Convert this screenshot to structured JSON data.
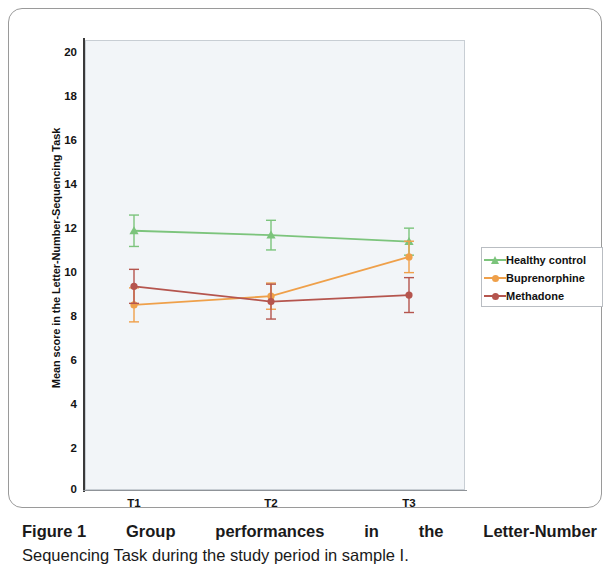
{
  "figure": {
    "caption_label": "Figure 1",
    "caption_line1_words": [
      "Group",
      "performances",
      "in",
      "the",
      "Letter-Number"
    ],
    "caption_line2": "Sequencing Task during the study period in sample I."
  },
  "axes": {
    "y_title": "Mean score in the Letter-Number-Sequencing Task",
    "y_ticks": [
      "20",
      "18",
      "16",
      "14",
      "12",
      "10",
      "8",
      "6",
      "4",
      "2",
      "0"
    ],
    "x_ticks": [
      "T1",
      "T2",
      "T3"
    ]
  },
  "legend": {
    "items": [
      {
        "label": "Healthy control",
        "color": "#7cc47c",
        "marker": "triangle-marker"
      },
      {
        "label": "Buprenorphine",
        "color": "#efa04a",
        "marker": "circle-marker"
      },
      {
        "label": "Methadone",
        "color": "#b5554e",
        "marker": "circle-marker"
      }
    ]
  },
  "colors": {
    "healthy_control": "#7cc47c",
    "buprenorphine": "#efa04a",
    "methadone": "#b5554e",
    "plot_background": "#f2f5f8",
    "axis": "#3a3a3a",
    "frame": "#9a9a9a"
  },
  "chart_data": {
    "type": "line",
    "title": "Figure 1 Group performances in the Letter-Number Sequencing Task during the study period in sample I.",
    "xlabel": "",
    "ylabel": "Mean score in the Letter-Number-Sequencing Task",
    "categories": [
      "T1",
      "T2",
      "T3"
    ],
    "ylim": [
      0,
      20
    ],
    "ytick_step": 2,
    "grid": false,
    "legend_position": "right",
    "error_bars": "standard error",
    "series": [
      {
        "name": "Healthy control",
        "color": "#7cc47c",
        "marker": "triangle",
        "values": [
          11.8,
          11.6,
          11.3
        ],
        "errors": [
          0.72,
          0.68,
          0.62
        ]
      },
      {
        "name": "Buprenorphine",
        "color": "#efa04a",
        "marker": "circle",
        "values": [
          8.4,
          8.8,
          10.6
        ],
        "errors": [
          0.78,
          0.6,
          0.72
        ]
      },
      {
        "name": "Methadone",
        "color": "#b5554e",
        "marker": "circle",
        "values": [
          9.25,
          8.55,
          8.85
        ],
        "errors": [
          0.78,
          0.8,
          0.8
        ]
      }
    ]
  }
}
